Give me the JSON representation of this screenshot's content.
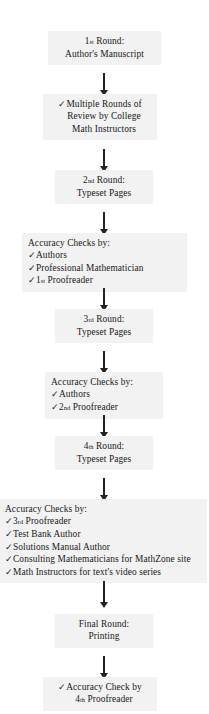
{
  "diagram": {
    "check_glyph": "✓",
    "box_fill": "#f2f2f2",
    "arrow_color": "#232323",
    "text_color": "#191919"
  },
  "nodes": [
    {
      "id": "round-1",
      "kind": "round",
      "lines": [
        "1st Round:",
        "Author's Manuscript"
      ],
      "line1_main": "1",
      "line1_sup": "st",
      "line1_rest": " Round:",
      "line2": "Author's Manuscript"
    },
    {
      "id": "review-rounds",
      "kind": "check-block",
      "lines": [
        "Multiple Rounds of",
        "Review by College",
        "Math Instructors"
      ],
      "text": "Multiple Rounds of Review by College Math Instructors"
    },
    {
      "id": "round-2",
      "kind": "round",
      "line1_main": "2",
      "line1_sup": "nd",
      "line1_rest": " Round:",
      "line2": "Typeset Pages"
    },
    {
      "id": "accuracy-checks-1",
      "kind": "checklist",
      "heading": "Accuracy Checks by:",
      "items": [
        {
          "text": "Authors"
        },
        {
          "text": "Professional Mathematician"
        },
        {
          "main": "1",
          "sup": "st",
          "rest": " Proofreader",
          "text": "1st Proofreader"
        }
      ]
    },
    {
      "id": "round-3",
      "kind": "round",
      "line1_main": "3",
      "line1_sup": "rd",
      "line1_rest": " Round:",
      "line2": "Typeset Pages"
    },
    {
      "id": "accuracy-checks-2",
      "kind": "checklist",
      "heading": "Accuracy Checks by:",
      "items": [
        {
          "text": "Authors"
        },
        {
          "main": "2",
          "sup": "nd",
          "rest": " Proofreader",
          "text": "2nd Proofreader"
        }
      ]
    },
    {
      "id": "round-4",
      "kind": "round",
      "line1_main": "4",
      "line1_sup": "th",
      "line1_rest": " Round:",
      "line2": "Typeset Pages"
    },
    {
      "id": "accuracy-checks-3",
      "kind": "checklist",
      "heading": "Accuracy Checks by:",
      "items": [
        {
          "main": "3",
          "sup": "rd",
          "rest": " Proofreader",
          "text": "3rd Proofreader"
        },
        {
          "text": "Test Bank Author"
        },
        {
          "text": "Solutions Manual Author"
        },
        {
          "text": "Consulting Mathematicians for MathZone site"
        },
        {
          "text": "Math Instructors for text's video series"
        }
      ]
    },
    {
      "id": "final-round",
      "kind": "round",
      "line1_main": "Final",
      "line1_sup": "",
      "line1_rest": " Round:",
      "line1": "Final Round:",
      "line2": "Printing"
    },
    {
      "id": "final-check",
      "kind": "check-block",
      "line1": "Accuracy Check by",
      "line2_main": "4",
      "line2_sup": "th",
      "line2_rest": " Proofreader",
      "text": "Accuracy Check by 4th Proofreader"
    }
  ],
  "connectors": [
    {
      "id": "arrow-1",
      "from": "round-1",
      "to": "review-rounds"
    },
    {
      "id": "arrow-2",
      "from": "review-rounds",
      "to": "round-2"
    },
    {
      "id": "arrow-3",
      "from": "round-2",
      "to": "accuracy-checks-1"
    },
    {
      "id": "arrow-4",
      "from": "accuracy-checks-1",
      "to": "round-3"
    },
    {
      "id": "arrow-5",
      "from": "round-3",
      "to": "accuracy-checks-2"
    },
    {
      "id": "arrow-6",
      "from": "accuracy-checks-2",
      "to": "round-4"
    },
    {
      "id": "arrow-7",
      "from": "round-4",
      "to": "accuracy-checks-3"
    },
    {
      "id": "arrow-8",
      "from": "accuracy-checks-3",
      "to": "final-round"
    },
    {
      "id": "arrow-9",
      "from": "final-round",
      "to": "final-check"
    }
  ]
}
